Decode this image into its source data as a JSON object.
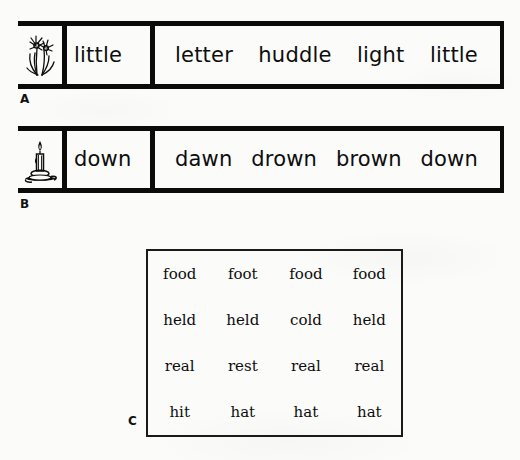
{
  "page": {
    "background_color": "#fbfbfa",
    "ink_color": "#0b0b0b"
  },
  "exercises": [
    {
      "label": "A",
      "icon": "flower-icon",
      "target_word": "little",
      "choices": [
        "letter",
        "huddle",
        "light",
        "little"
      ]
    },
    {
      "label": "B",
      "icon": "candle-icon",
      "target_word": "down",
      "choices": [
        "dawn",
        "drown",
        "brown",
        "down"
      ]
    }
  ],
  "grid_c": {
    "label": "C",
    "rows": [
      [
        "food",
        "foot",
        "food",
        "food"
      ],
      [
        "held",
        "held",
        "cold",
        "held"
      ],
      [
        "real",
        "rest",
        "real",
        "real"
      ],
      [
        "hit",
        "hat",
        "hat",
        "hat"
      ]
    ]
  }
}
